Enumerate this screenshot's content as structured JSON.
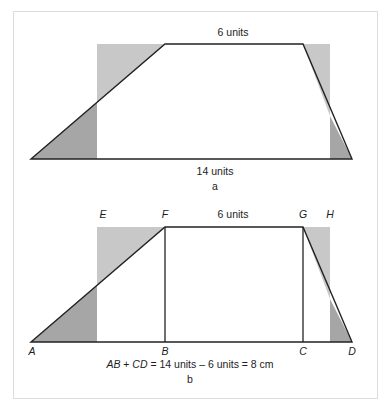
{
  "figure": {
    "background_color": "#ffffff",
    "frame_border_color": "#dcdcdc",
    "stroke_color": "#222222",
    "shade_light_color": "#c8c8c8",
    "shade_dark_color": "#a6a6a6"
  },
  "panel_a": {
    "tag": "a",
    "top_label": "6 units",
    "bottom_label": "14 units",
    "trapezoid": {
      "a_x": 31,
      "a_y": 159,
      "d_x": 352,
      "d_y": 159,
      "f_x": 165,
      "f_y": 44,
      "g_x": 303,
      "g_y": 44
    },
    "shade_left": {
      "x": 97,
      "y": 44,
      "w": 68,
      "h": 115
    },
    "shade_right": {
      "x": 303,
      "y": 44,
      "w": 27,
      "h": 115
    }
  },
  "panel_b": {
    "tag": "b",
    "top_label": "6 units",
    "vertex_labels": {
      "A": "A",
      "B": "B",
      "C": "C",
      "D": "D",
      "E": "E",
      "F": "F",
      "G": "G",
      "H": "H"
    },
    "equation": {
      "lhs_ab": "AB",
      "plus": " + ",
      "lhs_cd": "CD",
      "rest": " = 14 units – 6 units = 8 cm",
      "full_text": "AB + CD = 14 units – 6 units = 8 cm"
    },
    "trapezoid": {
      "a_x": 31,
      "a_y": 342,
      "d_x": 352,
      "d_y": 342,
      "f_x": 165,
      "f_y": 227,
      "g_x": 303,
      "g_y": 227
    },
    "shade_left": {
      "x": 97,
      "y": 227,
      "w": 68,
      "h": 115
    },
    "shade_right": {
      "x": 303,
      "y": 227,
      "w": 27,
      "h": 115
    },
    "inner_verticals": [
      {
        "name": "FB",
        "x": 165,
        "y1": 227,
        "y2": 342
      },
      {
        "name": "GC",
        "x": 303,
        "y1": 227,
        "y2": 342
      }
    ]
  },
  "labels": {
    "a_top_units_x": 233,
    "a_bottom_units_x": 215,
    "b_top_units_x": 233
  }
}
